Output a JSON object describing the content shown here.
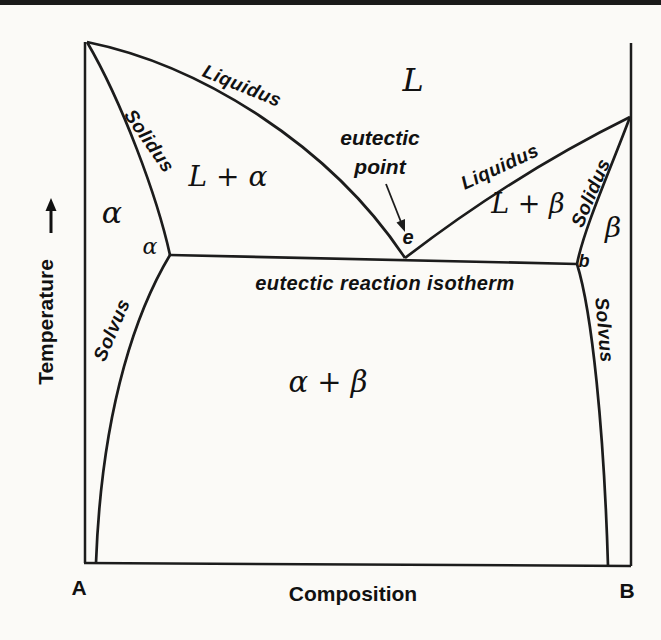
{
  "colors": {
    "line": "#1c1c1c",
    "text": "#111111",
    "background": "#fbfaf7",
    "top_rule": "#1a1a1a"
  },
  "axes": {
    "y_axis_label": "Temperature",
    "x_axis_label": "Composition",
    "x_left_end": "A",
    "x_right_end": "B"
  },
  "curve_labels": {
    "liquidus_left": "Liquidus",
    "solidus_left": "Solidus",
    "solvus_left": "Solvus",
    "liquidus_right": "Liquidus",
    "solidus_right": "Solidus",
    "solvus_right": "Solvus"
  },
  "phase_regions": {
    "liquid": "L",
    "liquid_plus_alpha": "L + α",
    "liquid_plus_beta": "L + β",
    "alpha": "α",
    "beta": "β",
    "alpha_plus_beta": "α + β"
  },
  "points": {
    "alpha_end": "α",
    "eutectic": "e",
    "b_end": "b"
  },
  "annotations": {
    "eutectic_point_line1": "eutectic",
    "eutectic_point_line2": "point",
    "isotherm": "eutectic reaction isotherm"
  }
}
